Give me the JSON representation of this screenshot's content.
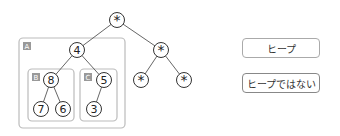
{
  "tree": {
    "nodes": [
      {
        "id": "root",
        "label": "*",
        "x": 117,
        "y": 20
      },
      {
        "id": "n4",
        "label": "4",
        "x": 77,
        "y": 50
      },
      {
        "id": "nr",
        "label": "*",
        "x": 161,
        "y": 50
      },
      {
        "id": "n8",
        "label": "8",
        "x": 51,
        "y": 80
      },
      {
        "id": "n5",
        "label": "5",
        "x": 104,
        "y": 80
      },
      {
        "id": "nrl",
        "label": "*",
        "x": 141,
        "y": 80
      },
      {
        "id": "nrr",
        "label": "*",
        "x": 184,
        "y": 80
      },
      {
        "id": "n7",
        "label": "7",
        "x": 41,
        "y": 109
      },
      {
        "id": "n6",
        "label": "6",
        "x": 63,
        "y": 109
      },
      {
        "id": "n3",
        "label": "3",
        "x": 94,
        "y": 109
      }
    ],
    "edges": [
      [
        "root",
        "n4"
      ],
      [
        "root",
        "nr"
      ],
      [
        "n4",
        "n8"
      ],
      [
        "n4",
        "n5"
      ],
      [
        "nr",
        "nrl"
      ],
      [
        "nr",
        "nrr"
      ],
      [
        "n8",
        "n7"
      ],
      [
        "n8",
        "n6"
      ],
      [
        "n5",
        "n3"
      ]
    ],
    "boxes": [
      {
        "label": "A",
        "x": 19,
        "y": 38,
        "w": 106,
        "h": 90
      },
      {
        "label": "B",
        "x": 28,
        "y": 69,
        "w": 46,
        "h": 52
      },
      {
        "label": "C",
        "x": 80,
        "y": 69,
        "w": 37,
        "h": 52
      }
    ]
  },
  "buttons": {
    "heap": "ヒープ",
    "not_heap": "ヒープではない"
  }
}
